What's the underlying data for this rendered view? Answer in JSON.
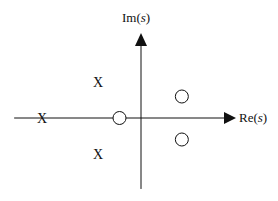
{
  "chart_data": {
    "type": "scatter",
    "xlabel": "Re(s)",
    "ylabel": "Im(s)",
    "pole_symbol": "X",
    "zero_symbol": "O",
    "poles": [
      {
        "re": -4.6,
        "im": 0
      },
      {
        "re": -2.0,
        "im": 1.67
      },
      {
        "re": -2.0,
        "im": -1.67
      }
    ],
    "zeros": [
      {
        "re": -1.0,
        "im": 0
      },
      {
        "re": 1.9,
        "im": 1.0
      },
      {
        "re": 1.9,
        "im": -1.0
      }
    ],
    "xlim": [
      -5.9,
      4.4
    ],
    "ylim": [
      -3.3,
      3.8
    ],
    "grid": false
  },
  "labels": {
    "re": "Re(s)",
    "im": "Im(s)"
  }
}
